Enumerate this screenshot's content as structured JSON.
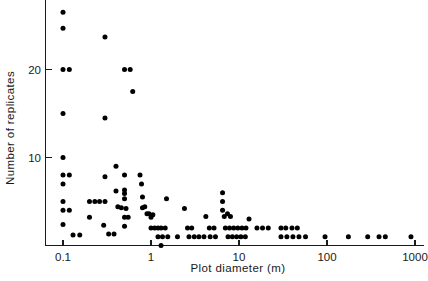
{
  "chart_data": {
    "type": "scatter",
    "title": "",
    "xlabel": "Plot diameter (m)",
    "ylabel": "Number of replicates",
    "xscale": "log",
    "yscale": "linear",
    "xlim": [
      0.07,
      1400
    ],
    "ylim": [
      0,
      28
    ],
    "grid": false,
    "legend": null,
    "xticks": [
      0.1,
      1,
      10,
      100,
      1000
    ],
    "xtick_labels": [
      "0.1",
      "1",
      "10",
      "100",
      "1000"
    ],
    "yticks": [
      10,
      20
    ],
    "ytick_labels": [
      "10",
      "20"
    ],
    "marker": "filled-circle",
    "marker_color": "#000000",
    "marker_size_px": 5,
    "points": [
      {
        "x": 0.1,
        "y": 26.5
      },
      {
        "x": 0.1,
        "y": 24.7
      },
      {
        "x": 0.1,
        "y": 20.0
      },
      {
        "x": 0.118,
        "y": 20.0
      },
      {
        "x": 0.1,
        "y": 15.0
      },
      {
        "x": 0.1,
        "y": 10.0
      },
      {
        "x": 0.1,
        "y": 8.0
      },
      {
        "x": 0.118,
        "y": 8.0
      },
      {
        "x": 0.1,
        "y": 7.0
      },
      {
        "x": 0.1,
        "y": 5.0
      },
      {
        "x": 0.1,
        "y": 4.0
      },
      {
        "x": 0.118,
        "y": 4.0
      },
      {
        "x": 0.1,
        "y": 2.4
      },
      {
        "x": 0.13,
        "y": 1.2
      },
      {
        "x": 0.155,
        "y": 1.2
      },
      {
        "x": 0.2,
        "y": 5.0
      },
      {
        "x": 0.2,
        "y": 3.2
      },
      {
        "x": 0.23,
        "y": 5.0
      },
      {
        "x": 0.26,
        "y": 5.0
      },
      {
        "x": 0.29,
        "y": 2.3
      },
      {
        "x": 0.3,
        "y": 23.7
      },
      {
        "x": 0.3,
        "y": 14.5
      },
      {
        "x": 0.3,
        "y": 7.8
      },
      {
        "x": 0.3,
        "y": 5.0
      },
      {
        "x": 0.33,
        "y": 1.3
      },
      {
        "x": 0.38,
        "y": 1.3
      },
      {
        "x": 0.4,
        "y": 9.0
      },
      {
        "x": 0.4,
        "y": 6.2
      },
      {
        "x": 0.42,
        "y": 4.4
      },
      {
        "x": 0.46,
        "y": 4.3
      },
      {
        "x": 0.5,
        "y": 20.0
      },
      {
        "x": 0.58,
        "y": 20.0
      },
      {
        "x": 0.5,
        "y": 8.0
      },
      {
        "x": 0.5,
        "y": 6.3
      },
      {
        "x": 0.5,
        "y": 5.9
      },
      {
        "x": 0.5,
        "y": 5.3
      },
      {
        "x": 0.52,
        "y": 4.2
      },
      {
        "x": 0.5,
        "y": 3.2
      },
      {
        "x": 0.55,
        "y": 3.2
      },
      {
        "x": 0.5,
        "y": 2.2
      },
      {
        "x": 0.62,
        "y": 17.5
      },
      {
        "x": 0.75,
        "y": 8.0
      },
      {
        "x": 0.78,
        "y": 7.0
      },
      {
        "x": 0.8,
        "y": 5.5
      },
      {
        "x": 0.8,
        "y": 4.3
      },
      {
        "x": 0.85,
        "y": 4.4
      },
      {
        "x": 0.9,
        "y": 3.6
      },
      {
        "x": 0.95,
        "y": 3.6
      },
      {
        "x": 1.0,
        "y": 3.2
      },
      {
        "x": 1.05,
        "y": 3.5
      },
      {
        "x": 1.0,
        "y": 2.0
      },
      {
        "x": 1.1,
        "y": 2.0
      },
      {
        "x": 1.2,
        "y": 2.0
      },
      {
        "x": 1.3,
        "y": 2.0
      },
      {
        "x": 1.45,
        "y": 2.0
      },
      {
        "x": 1.2,
        "y": 1.0
      },
      {
        "x": 1.35,
        "y": 1.0
      },
      {
        "x": 1.55,
        "y": 1.0
      },
      {
        "x": 1.3,
        "y": 0.0
      },
      {
        "x": 1.5,
        "y": 5.3
      },
      {
        "x": 2.0,
        "y": 1.0
      },
      {
        "x": 2.4,
        "y": 4.2
      },
      {
        "x": 2.6,
        "y": 2.0
      },
      {
        "x": 2.9,
        "y": 2.0
      },
      {
        "x": 2.7,
        "y": 1.0
      },
      {
        "x": 3.1,
        "y": 1.0
      },
      {
        "x": 3.5,
        "y": 1.0
      },
      {
        "x": 4.0,
        "y": 1.0
      },
      {
        "x": 4.2,
        "y": 3.3
      },
      {
        "x": 4.6,
        "y": 2.0
      },
      {
        "x": 5.2,
        "y": 2.0
      },
      {
        "x": 4.7,
        "y": 1.0
      },
      {
        "x": 5.4,
        "y": 1.0
      },
      {
        "x": 6.5,
        "y": 6.0
      },
      {
        "x": 6.5,
        "y": 5.0
      },
      {
        "x": 6.5,
        "y": 4.0
      },
      {
        "x": 6.8,
        "y": 3.3
      },
      {
        "x": 7.4,
        "y": 3.6
      },
      {
        "x": 8.0,
        "y": 3.3
      },
      {
        "x": 7.0,
        "y": 2.0
      },
      {
        "x": 7.8,
        "y": 2.0
      },
      {
        "x": 8.7,
        "y": 2.0
      },
      {
        "x": 9.7,
        "y": 2.0
      },
      {
        "x": 10.8,
        "y": 2.0
      },
      {
        "x": 12.0,
        "y": 2.0
      },
      {
        "x": 7.5,
        "y": 1.0
      },
      {
        "x": 8.4,
        "y": 1.0
      },
      {
        "x": 9.4,
        "y": 1.0
      },
      {
        "x": 10.5,
        "y": 1.0
      },
      {
        "x": 11.8,
        "y": 1.0
      },
      {
        "x": 13.0,
        "y": 3.0
      },
      {
        "x": 16.0,
        "y": 2.0
      },
      {
        "x": 18.5,
        "y": 2.0
      },
      {
        "x": 21.5,
        "y": 2.0
      },
      {
        "x": 30.0,
        "y": 2.0
      },
      {
        "x": 34.0,
        "y": 2.0
      },
      {
        "x": 40.0,
        "y": 2.0
      },
      {
        "x": 46.0,
        "y": 2.0
      },
      {
        "x": 30.0,
        "y": 1.0
      },
      {
        "x": 35.0,
        "y": 1.0
      },
      {
        "x": 41.0,
        "y": 1.0
      },
      {
        "x": 48.0,
        "y": 1.0
      },
      {
        "x": 57.0,
        "y": 1.0
      },
      {
        "x": 95.0,
        "y": 1.0
      },
      {
        "x": 175.0,
        "y": 1.0
      },
      {
        "x": 290.0,
        "y": 1.0
      },
      {
        "x": 390.0,
        "y": 1.0
      },
      {
        "x": 460.0,
        "y": 1.0
      },
      {
        "x": 900.0,
        "y": 1.0
      }
    ]
  },
  "figure": {
    "background_color": "#ffffff",
    "axis_color": "#1a1a1a"
  }
}
